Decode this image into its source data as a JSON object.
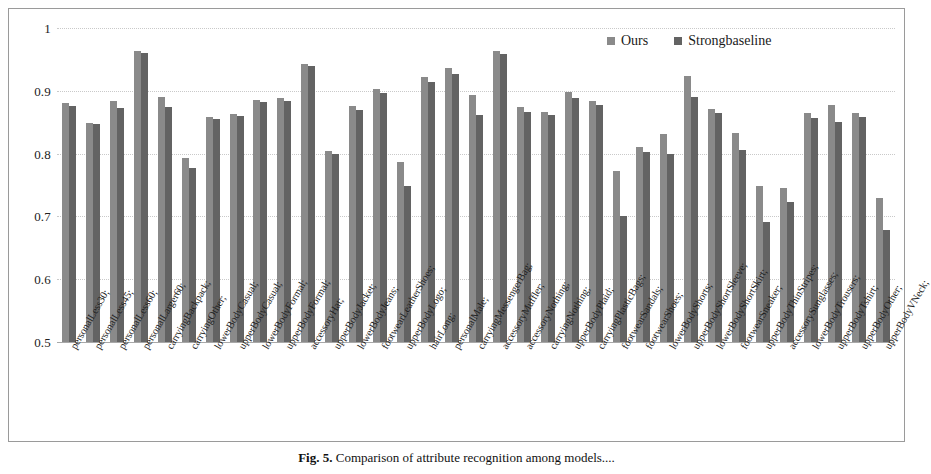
{
  "chart_data": {
    "type": "bar",
    "title": "",
    "xlabel": "",
    "ylabel": "",
    "ylim": [
      0.5,
      1.0
    ],
    "ytick_labels": [
      "1",
      "0.9",
      "0.8",
      "0.7",
      "0.6",
      "0.5"
    ],
    "ytick_values": [
      1.0,
      0.9,
      0.8,
      0.7,
      0.6,
      0.5
    ],
    "grid": true,
    "legend_position": "top-right",
    "categories": [
      "personalLess30;",
      "personalLess45;",
      "personalLess60;",
      "personalLarger60;",
      "carryingBackpack;",
      "carryingOther;",
      "lowerBodyCasual;",
      "upperBodyCasual;",
      "lowerBodyFormal;",
      "upperBodyFormal;",
      "accessoryHat;",
      "upperBodyJacket;",
      "lowerBodyJeans;",
      "footwearLeatherShoes;",
      "upperBodyLogo;",
      "hairLong;",
      "personalMale;",
      "carryingMessengerBag;",
      "accessoryMuffler;",
      "accessoryNothing;",
      "carryingNothing;",
      "upperBodyPlaid;",
      "carryingPlasticBags;",
      "footwearSandals;",
      "footwearShoes;",
      "lowerBodyShorts;",
      "upperBodyShortSleeve;",
      "lowerBodyShortSkirt;",
      "footwearSneaker;",
      "upperBodyThinStripes;",
      "accessorySunglasses;",
      "lowerBodyTrousers;",
      "upperBodyTshirt;",
      "upperBodyOther;",
      "upperBodyVNeck;"
    ],
    "series": [
      {
        "name": "Ours",
        "color": "#8a8a8a",
        "values": [
          0.881,
          0.848,
          0.884,
          0.963,
          0.89,
          0.793,
          0.858,
          0.863,
          0.886,
          0.889,
          0.943,
          0.804,
          0.876,
          0.903,
          0.786,
          0.922,
          0.936,
          0.893,
          0.963,
          0.874,
          0.866,
          0.898,
          0.884,
          0.772,
          0.81,
          0.831,
          0.923,
          0.871,
          0.833,
          0.749,
          0.745,
          0.864,
          0.878,
          0.864,
          0.729
        ]
      },
      {
        "name": "Strongbaseline",
        "color": "#636363",
        "values": [
          0.876,
          0.847,
          0.873,
          0.96,
          0.874,
          0.777,
          0.855,
          0.86,
          0.882,
          0.884,
          0.94,
          0.8,
          0.869,
          0.896,
          0.748,
          0.914,
          0.926,
          0.861,
          0.959,
          0.867,
          0.861,
          0.888,
          0.878,
          0.7,
          0.803,
          0.799,
          0.89,
          0.864,
          0.805,
          0.691,
          0.723,
          0.857,
          0.85,
          0.858,
          0.678
        ]
      }
    ]
  },
  "legend": {
    "items": [
      {
        "label": "Ours",
        "color": "#8a8a8a"
      },
      {
        "label": "Strongbaseline",
        "color": "#636363"
      }
    ]
  },
  "caption": {
    "figure_label": "Fig. 5.",
    "text": "Comparison of attribute recognition among models...."
  }
}
